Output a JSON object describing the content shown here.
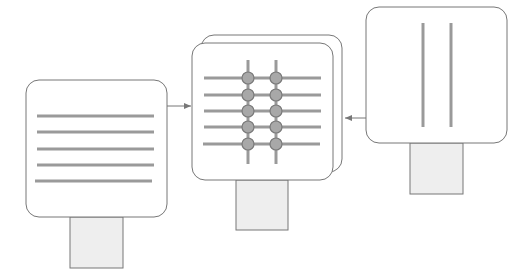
{
  "diagram": {
    "colors": {
      "border": "#777777",
      "line": "#9a9a9a",
      "stem_fill": "#eeeeee",
      "node_fill": "#a8a8a8",
      "node_stroke": "#7a7a7a",
      "background": "#ffffff"
    },
    "left_panel": {
      "pattern": "horizontal-lines",
      "line_count": 5
    },
    "center_panel": {
      "pattern": "grid",
      "horizontal_lines": 5,
      "vertical_lines": 2,
      "nodes": 10,
      "stacked": true
    },
    "right_panel": {
      "pattern": "vertical-lines",
      "line_count": 2
    },
    "arrows": [
      {
        "from": "left_panel",
        "to": "center_panel"
      },
      {
        "from": "right_panel",
        "to": "center_panel"
      }
    ]
  }
}
